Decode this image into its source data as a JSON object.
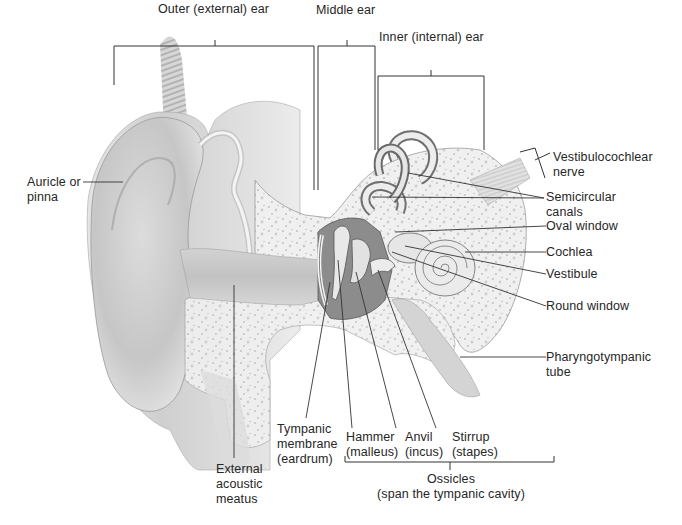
{
  "diagram": {
    "palette": {
      "skin_light": "#ececec",
      "skin_mid": "#d6d6d6",
      "skin_dark": "#b8b8b8",
      "bone": "#f1f1f1",
      "bone_speckle": "#c9c9c9",
      "cavity": "#8e8e8e",
      "line": "#333333"
    },
    "regions": {
      "outer": "Outer (external) ear",
      "middle": "Middle ear",
      "inner": "Inner (internal) ear"
    },
    "labels": {
      "auricle": [
        "Auricle or",
        "pinna"
      ],
      "vestibulocochlear": [
        "Vestibulocochlear",
        "nerve"
      ],
      "semicircular": [
        "Semicircular",
        "canals"
      ],
      "oval_window": "Oval window",
      "cochlea": "Cochlea",
      "vestibule": "Vestibule",
      "round_window": "Round window",
      "pharyngotympanic": [
        "Pharyngotympanic",
        "tube"
      ],
      "external_meatus": [
        "External",
        "acoustic",
        "meatus"
      ],
      "tympanic": [
        "Tympanic",
        "membrane",
        "(eardrum)"
      ],
      "hammer": [
        "Hammer",
        "(malleus)"
      ],
      "anvil": [
        "Anvil",
        "(incus)"
      ],
      "stirrup": [
        "Stirrup",
        "(stapes)"
      ],
      "ossicles": [
        "Ossicles",
        "(span the tympanic cavity)"
      ]
    }
  }
}
